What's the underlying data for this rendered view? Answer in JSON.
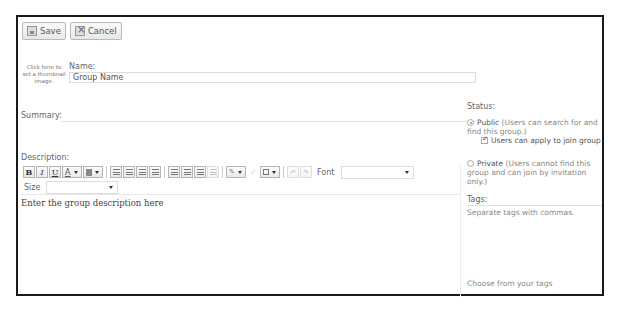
{
  "toolbar": {
    "save_label": "Save",
    "cancel_label": "Cancel"
  },
  "thumbnail": {
    "text": "Click here to set a thumbnail image."
  },
  "name": {
    "label": "Name:",
    "value": "Group Name"
  },
  "summary": {
    "label": "Summary:"
  },
  "description": {
    "label": "Description:",
    "toolbar": {
      "bold": "B",
      "italic": "I",
      "underline": "U",
      "font_color": "A",
      "font_label": "Font",
      "font_value": "",
      "size_label": "Size",
      "size_value": ""
    },
    "placeholder": "Enter the group description here"
  },
  "status": {
    "label": "Status:",
    "public": {
      "label": "Public",
      "note": "(Users can search for and find this group.)",
      "checked": true,
      "apply_option": {
        "label": "Users can apply to join group",
        "checked": true
      }
    },
    "private": {
      "label": "Private",
      "note": "(Users cannot find this group and can join by invitation only.)",
      "checked": false
    }
  },
  "tags": {
    "label": "Tags:",
    "placeholder": "Separate tags with commas.",
    "choose_link": "Choose from your tags"
  },
  "colors": {
    "frame_border": "#1a1a1a",
    "text": "#555555",
    "muted": "#888888"
  }
}
